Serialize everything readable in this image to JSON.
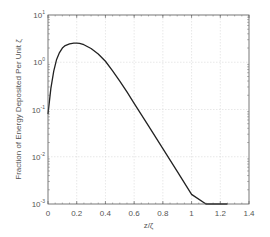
{
  "chart_data": {
    "type": "line",
    "title": "",
    "xlabel": "z/ζ",
    "ylabel": "Fraction of Energy Deposited Per Unit ζ",
    "xlim": [
      0,
      1.4
    ],
    "ylim": [
      0.001,
      10
    ],
    "yscale": "log",
    "grid": true,
    "x_ticks": [
      "0",
      "0.2",
      "0.4",
      "0.6",
      "0.8",
      "1",
      "1.2",
      "1.4"
    ],
    "x_tick_values": [
      0,
      0.2,
      0.4,
      0.6,
      0.8,
      1.0,
      1.2,
      1.4
    ],
    "y_ticks": [
      {
        "base": "10",
        "exp": "1",
        "value": 10
      },
      {
        "base": "10",
        "exp": "0",
        "value": 1
      },
      {
        "base": "10",
        "exp": "-1",
        "value": 0.1
      },
      {
        "base": "10",
        "exp": "-2",
        "value": 0.01
      },
      {
        "base": "10",
        "exp": "-3",
        "value": 0.001
      }
    ],
    "series": [
      {
        "name": "energy deposition",
        "color": "#222222",
        "x": [
          0.0,
          0.01,
          0.02,
          0.04,
          0.06,
          0.08,
          0.1,
          0.12,
          0.15,
          0.18,
          0.2,
          0.22,
          0.25,
          0.3,
          0.35,
          0.4,
          0.45,
          0.5,
          0.55,
          0.6,
          0.65,
          0.7,
          0.8,
          0.9,
          1.0,
          1.1,
          1.2,
          1.25
        ],
        "y": [
          0.08,
          0.15,
          0.28,
          0.65,
          1.15,
          1.6,
          2.0,
          2.25,
          2.45,
          2.55,
          2.55,
          2.5,
          2.35,
          1.95,
          1.5,
          1.05,
          0.66,
          0.4,
          0.235,
          0.135,
          0.078,
          0.045,
          0.0148,
          0.0049,
          0.0016,
          0.00053,
          0.00017,
          0.0001
        ]
      }
    ]
  }
}
